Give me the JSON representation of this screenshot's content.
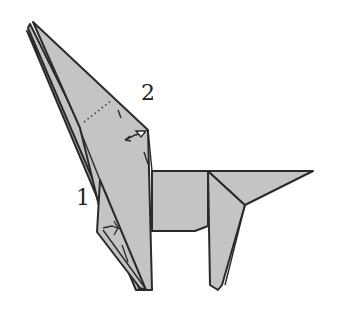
{
  "diagram": {
    "type": "origami-folding-step",
    "labels": [
      {
        "id": "step-1",
        "text": "1",
        "x": 76,
        "y": 187
      },
      {
        "id": "step-2",
        "text": "2",
        "x": 141,
        "y": 82
      }
    ],
    "colors": {
      "paper": "#c4c4c4",
      "outline": "#2a2a2a",
      "background": "#ffffff"
    },
    "annotations": [
      {
        "name": "valley-fold-line",
        "style": "dotted",
        "near": "step-2"
      },
      {
        "name": "fold-arrow",
        "style": "push/swing arrow",
        "near": "step-2"
      },
      {
        "name": "fold-arrow",
        "style": "push/swing arrow",
        "near": "step-1"
      }
    ]
  }
}
